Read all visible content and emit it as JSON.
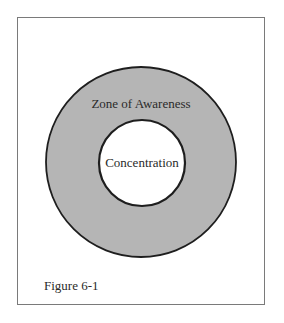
{
  "figure": {
    "caption": "Figure 6-1",
    "outer_label": "Zone of Awareness",
    "inner_label": "Concentration",
    "colors": {
      "ring_fill": "#b5b5b5",
      "inner_fill": "#ffffff",
      "stroke": "#1e1e1e",
      "frame": "#7a7a7a"
    }
  }
}
